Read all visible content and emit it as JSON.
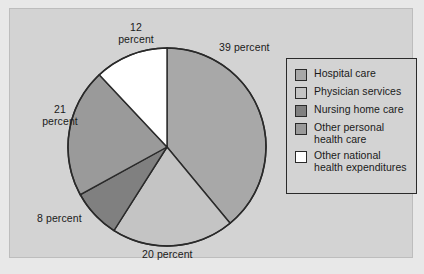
{
  "chart_data": {
    "type": "pie",
    "title": "",
    "categories": [
      "Hospital care",
      "Physician services",
      "Nursing home care",
      "Other personal health care",
      "Other national health expenditures"
    ],
    "values": [
      39,
      20,
      8,
      21,
      12
    ],
    "value_unit": "percent",
    "start_angle_deg": 0,
    "direction": "clockwise",
    "legend_position": "right",
    "grid": false,
    "slice_colors": [
      "#a8a8a8",
      "#c4c4c4",
      "#808080",
      "#9a9a9a",
      "#ffffff"
    ],
    "data_labels": [
      {
        "name": "hospital-care",
        "text": "39 percent",
        "value": 39,
        "lines": [
          "39 percent"
        ]
      },
      {
        "name": "physician-services",
        "text": "20 percent",
        "value": 20,
        "lines": [
          "20 percent"
        ]
      },
      {
        "name": "nursing-home-care",
        "text": "8 percent",
        "value": 8,
        "lines": [
          "8 percent"
        ]
      },
      {
        "name": "other-personal-health-care",
        "text": "21 percent",
        "value": 21,
        "lines": [
          "21",
          "percent"
        ]
      },
      {
        "name": "other-national-health-expenditures",
        "text": "12 percent",
        "value": 12,
        "lines": [
          "12",
          "percent"
        ]
      }
    ]
  },
  "labels": {
    "pct_39": "39 percent",
    "pct_20": "20 percent",
    "pct_8": "8 percent",
    "pct_21": "21\npercent",
    "pct_12": "12\npercent"
  },
  "legend": {
    "items": [
      {
        "label": "Hospital care",
        "color": "#a8a8a8",
        "value": 39
      },
      {
        "label": "Physician services",
        "color": "#c4c4c4",
        "value": 20
      },
      {
        "label": "Nursing home care",
        "color": "#808080",
        "value": 8
      },
      {
        "label": "Other personal\nhealth care",
        "color": "#9a9a9a",
        "value": 21
      },
      {
        "label": "Other national\nhealth expenditures",
        "color": "#ffffff",
        "value": 12
      }
    ]
  },
  "colors": {
    "page_background": "#e8e8e8",
    "frame_background": "#d3d3d3",
    "outline": "#2a2a2a",
    "text": "#1a1a1a"
  }
}
